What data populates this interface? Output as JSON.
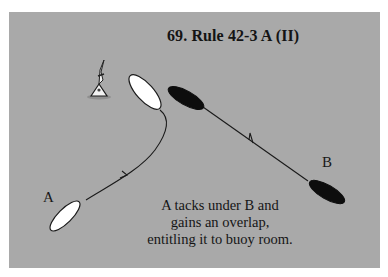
{
  "figure": {
    "title": "69.  Rule 42-3 A (II)",
    "caption_lines": [
      "A tacks under B and",
      "gains an overlap,",
      "entitling it to buoy room."
    ],
    "boats": [
      {
        "id": "A",
        "label": "A",
        "color": "#ffffff",
        "outline": "#1a1a1a"
      },
      {
        "id": "B",
        "label": "B",
        "color": "#0d0d0d",
        "outline": "#0d0d0d"
      }
    ],
    "mark": {
      "type": "buoy"
    },
    "colors": {
      "background": "#a9a9a9",
      "ink": "#141414"
    }
  }
}
